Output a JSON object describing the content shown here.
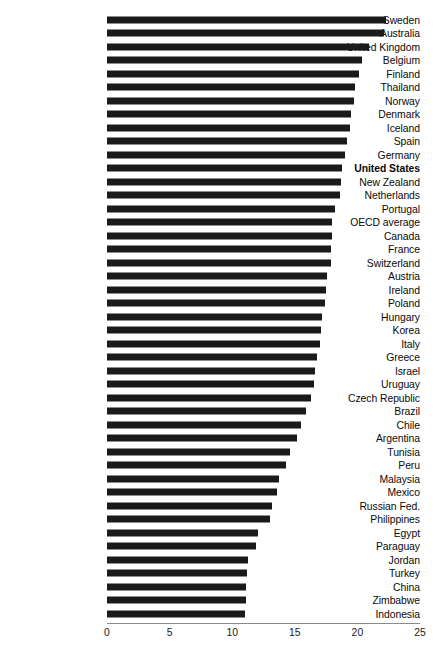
{
  "chart_data": {
    "type": "bar",
    "orientation": "horizontal",
    "title": "",
    "subtitle": "",
    "xlabel": "",
    "ylabel": "",
    "xlim": [
      0,
      25
    ],
    "grid": false,
    "legend": null,
    "bar_color": "#1a1a1a",
    "highlight_category": "United States",
    "xticks": [
      "0",
      "5",
      "10",
      "15",
      "20",
      "25"
    ],
    "xtick_values": [
      0,
      5,
      10,
      15,
      20,
      25
    ],
    "categories": [
      "Sweden",
      "Australia",
      "United Kingdom",
      "Belgium",
      "Finland",
      "Thailand",
      "Norway",
      "Denmark",
      "Iceland",
      "Spain",
      "Germany",
      "United States",
      "New Zealand",
      "Netherlands",
      "Portugal",
      "OECD average",
      "Canada",
      "France",
      "Switzerland",
      "Austria",
      "Ireland",
      "Poland",
      "Hungary",
      "Korea",
      "Italy",
      "Greece",
      "Israel",
      "Uruguay",
      "Czech Republic",
      "Brazil",
      "Chile",
      "Argentina",
      "Tunisia",
      "Peru",
      "Malaysia",
      "Mexico",
      "Russian Fed.",
      "Philippines",
      "Egypt",
      "Paraguay",
      "Jordan",
      "Turkey",
      "China",
      "Zimbabwe",
      "Indonesia"
    ],
    "values": [
      22.3,
      22.1,
      20.9,
      20.4,
      20.1,
      19.8,
      19.7,
      19.5,
      19.4,
      19.2,
      19.0,
      18.8,
      18.7,
      18.6,
      18.2,
      18.0,
      18.0,
      17.9,
      17.9,
      17.6,
      17.5,
      17.4,
      17.2,
      17.1,
      17.0,
      16.8,
      16.6,
      16.5,
      16.3,
      15.9,
      15.5,
      15.2,
      14.6,
      14.3,
      13.7,
      13.6,
      13.2,
      13.0,
      12.1,
      11.9,
      11.3,
      11.2,
      11.1,
      11.1,
      11.0
    ]
  },
  "layout": {
    "plot_left_px": 107,
    "plot_right_px": 420,
    "first_row_top_px": 13,
    "row_pitch_px": 13.5,
    "bar_height_px": 7
  }
}
